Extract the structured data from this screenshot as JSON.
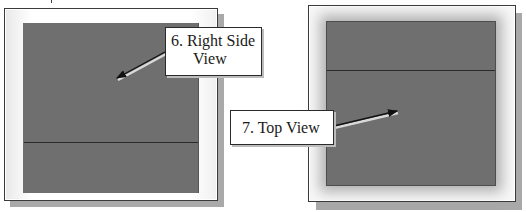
{
  "figure": {
    "left_view": {
      "name": "Right Side View",
      "callout": {
        "number": "6.",
        "line1": "6. Right Side",
        "line2": "View"
      }
    },
    "right_view": {
      "name": "Top View",
      "callout": {
        "number": "7.",
        "line1": "7. Top View"
      }
    }
  },
  "colors": {
    "view_fill": "#6f6f6f",
    "frame_border": "#3a3a3a",
    "shadow": "#a9a9a9",
    "callout_bg": "#ffffff",
    "text": "#1a1a1a"
  }
}
